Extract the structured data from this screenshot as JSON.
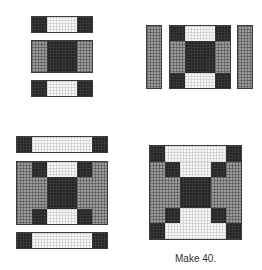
{
  "diagram": {
    "type": "quilt-block-assembly",
    "colors": {
      "dark": "#262626",
      "medium": "#9a9a9a",
      "light": "#f7f7f7"
    },
    "steps": [
      {
        "id": "step-1",
        "description": "Three rows: dark-light-dark strip, medium-dark-medium row, dark-light-dark strip"
      },
      {
        "id": "step-2",
        "description": "Medium side bars added to left and right of 9-patch unit"
      },
      {
        "id": "step-3",
        "description": "Dark-light-dark strips added to top and bottom of widened unit"
      },
      {
        "id": "step-4",
        "description": "Finished block"
      }
    ],
    "caption": "Make 40."
  }
}
